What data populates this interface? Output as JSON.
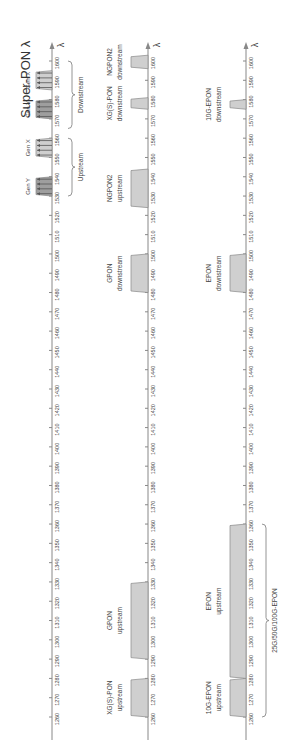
{
  "figure": {
    "title": "Super-PON λ",
    "axis_symbol": "λ",
    "orientation": "rotated-90-ccw",
    "tick_labels": [
      "1260",
      "1270",
      "1280",
      "1290",
      "1300",
      "1310",
      "1320",
      "1330",
      "1340",
      "1350",
      "1360",
      "1370",
      "1380",
      "1390",
      "1400",
      "1410",
      "1420",
      "1430",
      "1440",
      "1450",
      "1460",
      "1470",
      "1480",
      "1490",
      "1500",
      "1510",
      "1520",
      "1530",
      "1540",
      "1550",
      "1560",
      "1570",
      "1580",
      "1590",
      "1600"
    ],
    "axis_range_nm": [
      1260,
      1600
    ],
    "colors": {
      "band_fill": "#cfcfcf",
      "band_fill_dark": "#9e9e9e",
      "band_stroke": "#888888",
      "axis": "#888888",
      "text": "#444444"
    }
  },
  "panels": [
    {
      "name": "super-pon",
      "bands": [
        {
          "label": "Gen Y",
          "from": 1530,
          "to": 1540,
          "shade": "dark",
          "channels": 4
        },
        {
          "label": "Gen X",
          "from": 1550,
          "to": 1560,
          "shade": "light",
          "channels": 4
        },
        {
          "label": "Gen Y",
          "from": 1570,
          "to": 1580,
          "shade": "dark",
          "channels": 4
        },
        {
          "label": "Gen X",
          "from": 1585,
          "to": 1595,
          "shade": "light",
          "channels": 4
        }
      ],
      "brackets": [
        {
          "label": "Upstream",
          "from": 1530,
          "to": 1560
        },
        {
          "label": "Downstream",
          "from": 1565,
          "to": 1600
        }
      ]
    },
    {
      "name": "itu-pon",
      "bands": [
        {
          "label": "XG(S)-PON upstream",
          "from": 1260,
          "to": 1280
        },
        {
          "label": "GPON upstream",
          "from": 1290,
          "to": 1330
        },
        {
          "label": "GPON downstream",
          "from": 1480,
          "to": 1500
        },
        {
          "label": "NGPON2 upstream",
          "from": 1524,
          "to": 1544
        },
        {
          "label": "XG(S)-PON downstream",
          "from": 1575,
          "to": 1581
        },
        {
          "label": "NGPON2 downstream",
          "from": 1596,
          "to": 1603
        }
      ]
    },
    {
      "name": "ieee-epon",
      "bands": [
        {
          "label": "10G-EPON upstream",
          "from": 1260,
          "to": 1280
        },
        {
          "label": "EPON upstream",
          "from": 1280,
          "to": 1360
        },
        {
          "label": "EPON downstream",
          "from": 1480,
          "to": 1500
        },
        {
          "label": "10G-EPON downstream",
          "from": 1575,
          "to": 1580
        }
      ],
      "brackets": [
        {
          "label": "25G/50G/100G-EPON",
          "from": 1260,
          "to": 1360
        }
      ]
    }
  ]
}
